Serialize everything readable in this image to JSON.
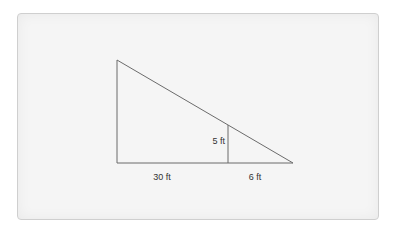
{
  "diagram": {
    "type": "similar-triangles",
    "colors": {
      "card_fill": "#f5f5f5",
      "card_border": "#cfcfcf",
      "line": "#6b6b6b",
      "text": "#333333"
    },
    "labels": {
      "base_left": "30 ft",
      "base_right": "6 ft",
      "inner_height": "5 ft"
    },
    "shapes": {
      "outer_triangle": {
        "top": [
          117,
          60
        ],
        "bottom_left": [
          117,
          163
        ],
        "bottom_right": [
          293,
          163
        ]
      },
      "inner_segment": {
        "top": [
          228,
          125
        ],
        "bottom": [
          228,
          163
        ]
      }
    }
  }
}
